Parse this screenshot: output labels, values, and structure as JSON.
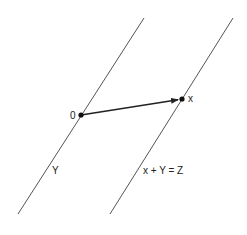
{
  "diagram": {
    "colors": {
      "line": "#555555",
      "vector": "#222222",
      "point": "#111111",
      "background": "#ffffff"
    },
    "lines": [
      {
        "id": "Y",
        "x1": 18,
        "y1": 214,
        "x2": 144,
        "y2": 18,
        "label": "Y"
      },
      {
        "id": "x+Y",
        "x1": 110,
        "y1": 214,
        "x2": 233,
        "y2": 18,
        "label": "x + Y = Z"
      }
    ],
    "points": [
      {
        "id": "origin",
        "cx": 81,
        "cy": 115,
        "label": "0"
      },
      {
        "id": "x",
        "cx": 182,
        "cy": 99,
        "label": "x"
      }
    ],
    "vector": {
      "from": "origin",
      "to": "x"
    },
    "labels": {
      "origin": "0",
      "point_x": "x",
      "line_y": "Y",
      "line_shifted": "x + Y = Z"
    }
  }
}
